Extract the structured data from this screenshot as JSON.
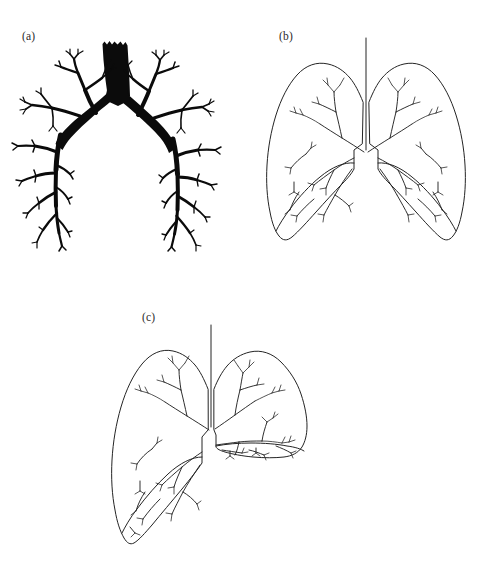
{
  "figure": {
    "kind": "scientific-line-figure",
    "background_color": "#ffffff",
    "ink_color": "#242424",
    "silhouette_color": "#0b0b0b",
    "clipped_header_text": "",
    "panels": [
      {
        "id": "a",
        "label": "(a)",
        "caption": "",
        "subject": "bronchial tree",
        "style": "solid black silhouette",
        "description": "Trachea with notched superior margin descending to the carina, bifurcating into left and right main bronchi with progressively tapering dichotomous branches ending in fine terminal twigs."
      },
      {
        "id": "b",
        "label": "(b)",
        "caption": "",
        "subject": "normal lungs with bronchial tree",
        "style": "thin outline drawing",
        "description": "Symmetric pair of lungs in outline with a vertical trachea entering the notch between the apices; thin-line airways branch through both lungs to the bases."
      },
      {
        "id": "c",
        "label": "(c)",
        "caption": "",
        "subject": "asymmetric lungs with shifted mediastinum",
        "style": "thin outline drawing",
        "description": "Left lung hyperinflated and elongated to a low base while the right lung is reduced and compressed with crowded airway branches; the trachea and mediastinum are deviated toward the smaller lung."
      }
    ]
  }
}
